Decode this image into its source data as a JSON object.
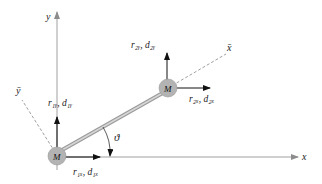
{
  "diagram": {
    "axes": {
      "y_label": "y",
      "x_label": "x",
      "ybar_label": "ȳ",
      "xbar_label": "x̄"
    },
    "nodes": [
      {
        "id": "node1",
        "label": "M",
        "pos": [
          55,
          152
        ]
      },
      {
        "id": "node2",
        "label": "M",
        "pos": [
          168,
          88
        ]
      }
    ],
    "element": {
      "type": "truss-bar",
      "from": "node1",
      "to": "node2"
    },
    "angle_label": "ϑ",
    "node1_labels": {
      "y_dof": "r₁ᵧ, d₁ᵧ",
      "x_dof": "r₁ₓ, d₁ₓ"
    },
    "node2_labels": {
      "y_dof": "r₂ᵧ, d₂ᵧ",
      "x_dof": "r₂ₓ, d₂ₓ"
    },
    "colors": {
      "axis": "#9a9a9a",
      "bar": "#a8a8a8",
      "node": "#b5b5b5",
      "arrow": "#111111"
    }
  }
}
